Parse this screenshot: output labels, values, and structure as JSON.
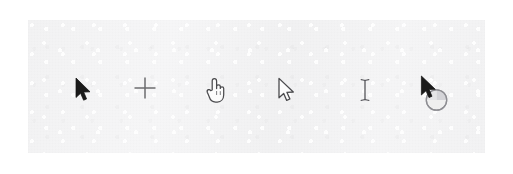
{
  "canvas": {
    "width": 513,
    "height": 174,
    "page_background": "#ffffff"
  },
  "panel": {
    "name": "cursor-sample-sheet",
    "background": "#f4f4f5",
    "x": 28,
    "y": 20,
    "width": 457,
    "height": 133,
    "texture": "scanned-paper-grain"
  },
  "cursors": [
    {
      "icon": "arrow-pointer-icon",
      "label": "Normal Select",
      "style": "filled",
      "fill": "#1a1a1a",
      "stroke": "#1a1a1a",
      "x": 74,
      "y": 77,
      "scale": 1.0
    },
    {
      "icon": "crosshair-icon",
      "label": "Precision Select",
      "style": "outline",
      "fill": "none",
      "stroke": "#6b6b6e",
      "x": 133,
      "y": 76,
      "scale": 1.0
    },
    {
      "icon": "pointing-hand-icon",
      "label": "Link Select",
      "style": "outline",
      "fill": "#fbfbfb",
      "stroke": "#4a4a4d",
      "x": 204,
      "y": 77,
      "scale": 1.0
    },
    {
      "icon": "arrow-pointer-outline-icon",
      "label": "Alternate Select",
      "style": "outline",
      "fill": "#fbfbfb",
      "stroke": "#4a4a4d",
      "x": 277,
      "y": 77,
      "scale": 1.0
    },
    {
      "icon": "text-ibeam-icon",
      "label": "Text Select",
      "style": "outline",
      "fill": "none",
      "stroke": "#55555a",
      "x": 358,
      "y": 77,
      "scale": 1.0
    },
    {
      "icon": "arrow-busy-icon",
      "label": "Working In Background",
      "style": "filled-with-spinner",
      "fill": "#1a1a1a",
      "stroke": "#8d8d92",
      "x": 418,
      "y": 74,
      "scale": 1.0
    }
  ]
}
